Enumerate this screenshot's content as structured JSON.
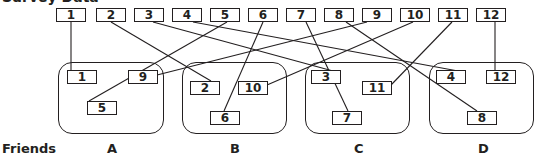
{
  "title": "Survey Data",
  "row_label": "Friends",
  "top_boxes": [
    {
      "id": "1",
      "x": 56,
      "y": 8,
      "w": 30
    },
    {
      "id": "2",
      "x": 96,
      "y": 8,
      "w": 30
    },
    {
      "id": "3",
      "x": 134,
      "y": 8,
      "w": 30
    },
    {
      "id": "4",
      "x": 172,
      "y": 8,
      "w": 30
    },
    {
      "id": "5",
      "x": 210,
      "y": 8,
      "w": 30
    },
    {
      "id": "6",
      "x": 248,
      "y": 8,
      "w": 30
    },
    {
      "id": "7",
      "x": 286,
      "y": 8,
      "w": 30
    },
    {
      "id": "8",
      "x": 324,
      "y": 8,
      "w": 30
    },
    {
      "id": "9",
      "x": 362,
      "y": 8,
      "w": 30
    },
    {
      "id": "10",
      "x": 400,
      "y": 8,
      "w": 30
    },
    {
      "id": "11",
      "x": 438,
      "y": 8,
      "w": 30
    },
    {
      "id": "12",
      "x": 476,
      "y": 8,
      "w": 30
    }
  ],
  "groups": [
    {
      "label": "A",
      "x": 58,
      "y": 62,
      "w": 106,
      "h": 72,
      "label_x": 107
    },
    {
      "label": "B",
      "x": 182,
      "y": 62,
      "w": 105,
      "h": 72,
      "label_x": 230
    },
    {
      "label": "C",
      "x": 305,
      "y": 62,
      "w": 105,
      "h": 72,
      "label_x": 354
    },
    {
      "label": "D",
      "x": 429,
      "y": 62,
      "w": 105,
      "h": 72,
      "label_x": 478
    }
  ],
  "inner_boxes": [
    {
      "id": "1",
      "group": "A",
      "x": 67,
      "y": 70,
      "w": 30
    },
    {
      "id": "9",
      "group": "A",
      "x": 128,
      "y": 70,
      "w": 30
    },
    {
      "id": "5",
      "group": "A",
      "x": 87,
      "y": 101,
      "w": 30
    },
    {
      "id": "2",
      "group": "B",
      "x": 190,
      "y": 81,
      "w": 30
    },
    {
      "id": "10",
      "group": "B",
      "x": 238,
      "y": 81,
      "w": 30
    },
    {
      "id": "6",
      "group": "B",
      "x": 210,
      "y": 111,
      "w": 30
    },
    {
      "id": "3",
      "group": "C",
      "x": 311,
      "y": 70,
      "w": 30
    },
    {
      "id": "11",
      "group": "C",
      "x": 362,
      "y": 81,
      "w": 30
    },
    {
      "id": "7",
      "group": "C",
      "x": 332,
      "y": 111,
      "w": 30
    },
    {
      "id": "4",
      "group": "D",
      "x": 436,
      "y": 70,
      "w": 30
    },
    {
      "id": "12",
      "group": "D",
      "x": 486,
      "y": 70,
      "w": 30
    },
    {
      "id": "8",
      "group": "D",
      "x": 467,
      "y": 111,
      "w": 30
    }
  ],
  "connections": [
    {
      "from": "1",
      "to_group": "A",
      "x1": 71,
      "y1": 22,
      "x2": 71,
      "y2": 70
    },
    {
      "from": "2",
      "to_group": "B",
      "x1": 111,
      "y1": 22,
      "x2": 211,
      "y2": 81
    },
    {
      "from": "3",
      "to_group": "C",
      "x1": 153,
      "y1": 22,
      "x2": 333,
      "y2": 71
    },
    {
      "from": "4",
      "to_group": "D",
      "x1": 193,
      "y1": 22,
      "x2": 458,
      "y2": 71
    },
    {
      "from": "5",
      "to_group": "A",
      "x1": 227,
      "y1": 22,
      "x2": 89,
      "y2": 101
    },
    {
      "from": "6",
      "to_group": "B",
      "x1": 263,
      "y1": 22,
      "x2": 224,
      "y2": 111
    },
    {
      "from": "7",
      "to_group": "C",
      "x1": 306,
      "y1": 22,
      "x2": 348,
      "y2": 111
    },
    {
      "from": "8",
      "to_group": "D",
      "x1": 346,
      "y1": 22,
      "x2": 477,
      "y2": 111
    },
    {
      "from": "9",
      "to_group": "A",
      "x1": 367,
      "y1": 22,
      "x2": 157,
      "y2": 75
    },
    {
      "from": "10",
      "to_group": "B",
      "x1": 413,
      "y1": 22,
      "x2": 267,
      "y2": 85
    },
    {
      "from": "11",
      "to_group": "C",
      "x1": 452,
      "y1": 22,
      "x2": 391,
      "y2": 85
    },
    {
      "from": "12",
      "to_group": "D",
      "x1": 495,
      "y1": 22,
      "x2": 495,
      "y2": 70
    }
  ]
}
